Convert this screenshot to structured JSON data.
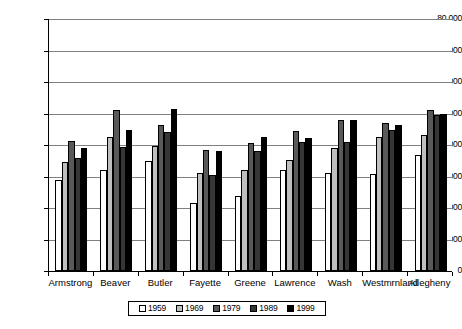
{
  "chart_data": {
    "type": "bar",
    "title": "",
    "subtitle": "",
    "xlabel": "",
    "ylabel": "",
    "ylim": [
      0,
      80000
    ],
    "ytick_step": 10000,
    "ytick_labels": [
      "0",
      "10,000",
      "20,000",
      "30,000",
      "40,000",
      "50,000",
      "60,000",
      "70,000",
      "80,000"
    ],
    "ytick_values": [
      0,
      10000,
      20000,
      30000,
      40000,
      50000,
      60000,
      70000,
      80000
    ],
    "grid": "horizontal",
    "legend_position": "bottom",
    "categories": [
      "Armstrong",
      "Beaver",
      "Butler",
      "Fayette",
      "Greene",
      "Lawrence",
      "Wash",
      "Westmrnland",
      "Allegheny"
    ],
    "series": [
      {
        "name": "1959",
        "color": "#ffffff",
        "values": [
          28800,
          32000,
          35000,
          21600,
          23800,
          32000,
          31000,
          30900,
          36800
        ]
      },
      {
        "name": "1969",
        "color": "#bfbfbf",
        "values": [
          34500,
          42400,
          39800,
          31100,
          32000,
          35200,
          39000,
          42700,
          43200
        ]
      },
      {
        "name": "1979",
        "color": "#595959",
        "values": [
          41200,
          51200,
          46300,
          38400,
          40600,
          44400,
          47800,
          47000,
          51200
        ]
      },
      {
        "name": "1989",
        "color": "#363636",
        "values": [
          35800,
          39400,
          44000,
          30600,
          38200,
          40900,
          41000,
          44800,
          49400
        ]
      },
      {
        "name": "1999",
        "color": "#000000",
        "values": [
          38900,
          44800,
          51300,
          38200,
          42700,
          42300,
          47900,
          46200,
          49800
        ]
      }
    ]
  },
  "legend": {
    "items": [
      {
        "label": "1959"
      },
      {
        "label": "1969"
      },
      {
        "label": "1979"
      },
      {
        "label": "1989"
      },
      {
        "label": "1999"
      }
    ]
  }
}
